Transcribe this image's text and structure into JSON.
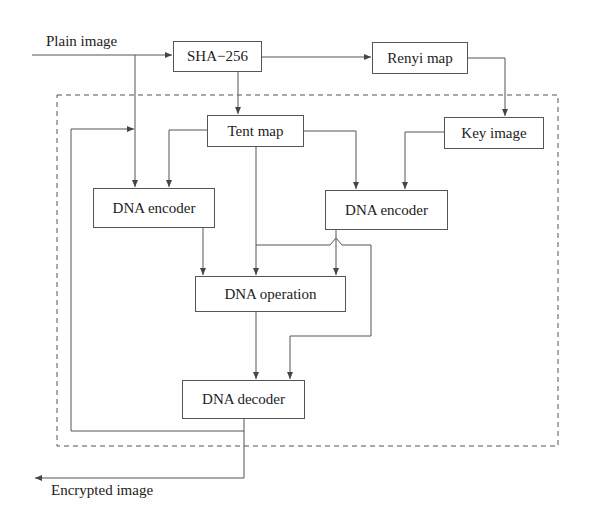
{
  "diagram": {
    "type": "flowchart",
    "title": "",
    "inputs": {
      "plain_image": "Plain image"
    },
    "outputs": {
      "encrypted_image": "Encrypted image"
    },
    "nodes": {
      "sha": "SHA−256",
      "renyi": "Renyi map",
      "key_image": "Key image",
      "tent": "Tent map",
      "dna_encoder_left": "DNA encoder",
      "dna_encoder_right": "DNA encoder",
      "dna_operation": "DNA operation",
      "dna_decoder": "DNA decoder"
    },
    "edges": [
      [
        "Plain image",
        "SHA-256"
      ],
      [
        "Plain image",
        "DNA encoder (left)"
      ],
      [
        "SHA-256",
        "Renyi map"
      ],
      [
        "SHA-256",
        "Tent map"
      ],
      [
        "Renyi map",
        "Key image"
      ],
      [
        "Key image",
        "DNA encoder (right)"
      ],
      [
        "Tent map",
        "DNA encoder (left)"
      ],
      [
        "Tent map",
        "DNA encoder (right)"
      ],
      [
        "Tent map",
        "DNA operation"
      ],
      [
        "Tent map",
        "DNA decoder"
      ],
      [
        "DNA encoder (left)",
        "DNA operation"
      ],
      [
        "DNA encoder (right)",
        "DNA operation"
      ],
      [
        "DNA operation",
        "DNA decoder"
      ],
      [
        "DNA decoder",
        "Encrypted image"
      ],
      [
        "DNA decoder",
        "DNA encoder (left) feedback"
      ]
    ],
    "colors": {
      "line": "#555555",
      "text": "#222222",
      "background": "#fefefe"
    }
  }
}
